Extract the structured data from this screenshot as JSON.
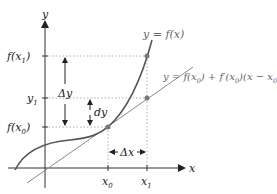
{
  "diagram": {
    "axes": {
      "x_label": "x",
      "y_label": "y"
    },
    "y_ticks": [
      {
        "label": "f(x",
        "sub": "1",
        "close": ")",
        "name": "f-x1"
      },
      {
        "label": "y",
        "sub": "1",
        "close": "",
        "name": "y1"
      },
      {
        "label": "f(x",
        "sub": "0",
        "close": ")",
        "name": "f-x0"
      }
    ],
    "x_ticks": [
      {
        "label": "x",
        "sub": "0"
      },
      {
        "label": "x",
        "sub": "1"
      }
    ],
    "curve_label": "y = f(x)",
    "tangent_label": {
      "p1": "y = f(x",
      "s1": "0",
      "p2": ") + f′(x",
      "s2": "0",
      "p3": ")(x − x",
      "s3": "0",
      "p4": ")"
    },
    "delta_y": "Δy",
    "dy": "dy",
    "delta_x": "Δx",
    "colors": {
      "axis": "#333333",
      "curve": "#555555",
      "tangent": "#888888",
      "point": "#777777",
      "dotted": "#999999"
    }
  }
}
